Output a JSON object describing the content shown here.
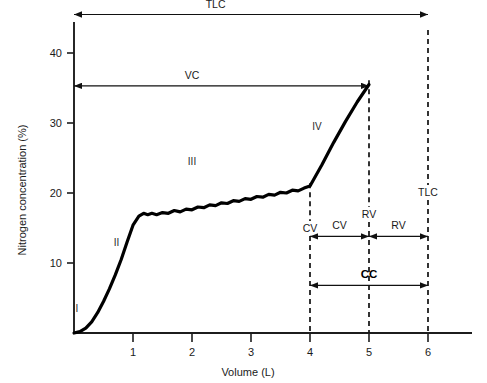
{
  "chart_data": {
    "type": "line",
    "title": "",
    "xlabel": "Volume (L)",
    "ylabel": "Nitrogen concentration (%)",
    "xlim": [
      0,
      6.6
    ],
    "ylim": [
      0,
      53
    ],
    "xticks": [
      "1",
      "2",
      "3",
      "4",
      "5",
      "6"
    ],
    "xtick_values": [
      1,
      2,
      3,
      4,
      5,
      6
    ],
    "yticks": [
      "10",
      "20",
      "30",
      "40",
      "50"
    ],
    "ytick_values": [
      10,
      20,
      30,
      40,
      50
    ],
    "grid": false,
    "legend_position": "none",
    "series": [
      {
        "name": "Single-breath nitrogen washout",
        "x": [
          0.0,
          0.1,
          0.2,
          0.3,
          0.4,
          0.5,
          0.6,
          0.7,
          0.8,
          0.9,
          1.0,
          1.1,
          1.18,
          1.25,
          1.32,
          1.4,
          1.5,
          1.6,
          1.7,
          1.8,
          1.9,
          2.0,
          2.1,
          2.2,
          2.3,
          2.4,
          2.5,
          2.6,
          2.7,
          2.8,
          2.9,
          3.0,
          3.1,
          3.2,
          3.3,
          3.4,
          3.5,
          3.6,
          3.7,
          3.8,
          3.9,
          4.0,
          4.2,
          4.4,
          4.6,
          4.8,
          5.0
        ],
        "y": [
          0.0,
          0.2,
          0.7,
          1.6,
          2.9,
          4.5,
          6.3,
          8.3,
          10.5,
          13.0,
          15.4,
          16.7,
          17.1,
          16.9,
          17.1,
          16.9,
          17.2,
          17.1,
          17.5,
          17.3,
          17.7,
          17.6,
          18.0,
          17.9,
          18.3,
          18.2,
          18.6,
          18.5,
          18.9,
          18.8,
          19.2,
          19.1,
          19.5,
          19.4,
          19.8,
          19.7,
          20.1,
          20.0,
          20.4,
          20.3,
          20.7,
          21.0,
          24.0,
          27.2,
          30.2,
          33.0,
          35.5
        ]
      }
    ],
    "phases": [
      {
        "label": "I",
        "x": 0.05,
        "y": 3.0
      },
      {
        "label": "II",
        "x": 0.72,
        "y": 12.5
      },
      {
        "label": "III",
        "x": 2.0,
        "y": 24.0
      },
      {
        "label": "IV",
        "x": 4.12,
        "y": 29.0
      }
    ],
    "reference_lines": [
      {
        "name": "CV",
        "x": 4,
        "label": "CV"
      },
      {
        "name": "RV",
        "x": 5,
        "label": "RV"
      },
      {
        "name": "TLC",
        "x": 6,
        "label": "TLC"
      }
    ],
    "measurements": [
      {
        "name": "TLC",
        "label": "TLC",
        "from_x": 0,
        "to_x": 6,
        "y": 45.5
      },
      {
        "name": "VC",
        "label": "VC",
        "from_x": 0,
        "to_x": 5,
        "y": 35.3
      },
      {
        "name": "CV",
        "label": "CV",
        "from_x": 4,
        "to_x": 5,
        "y": 13.8
      },
      {
        "name": "RV",
        "label": "RV",
        "from_x": 5,
        "to_x": 6,
        "y": 13.8
      },
      {
        "name": "CC",
        "label": "CC",
        "from_x": 4,
        "to_x": 6,
        "y": 6.8
      }
    ]
  },
  "colors": {
    "curve": "#000000",
    "axis": "#1c1c1c",
    "annotation": "#111111",
    "background": "#ffffff"
  }
}
